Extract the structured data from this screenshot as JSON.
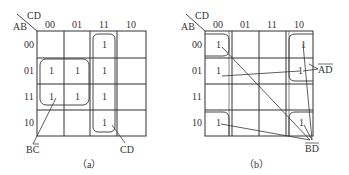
{
  "diagrams": [
    {
      "id": "a",
      "caption": "（a）",
      "row_var": "AB",
      "col_var": "CD",
      "col_labels": [
        "00",
        "01",
        "11",
        "10"
      ],
      "row_labels": [
        "00",
        "01",
        "11",
        "10"
      ],
      "cells": [
        [
          "",
          "",
          "1",
          ""
        ],
        [
          "1",
          "1",
          "1",
          ""
        ],
        [
          "1",
          "1",
          "1",
          ""
        ],
        [
          "",
          "",
          "1",
          ""
        ]
      ],
      "groups": [
        {
          "label": "BC̄",
          "label_main": "BC",
          "overbar": "C",
          "cells": [
            [
              1,
              0
            ],
            [
              1,
              1
            ],
            [
              2,
              0
            ],
            [
              2,
              1
            ]
          ]
        },
        {
          "label": "CD",
          "label_main": "CD",
          "overbar": "",
          "cells": [
            [
              0,
              2
            ],
            [
              1,
              2
            ],
            [
              2,
              2
            ],
            [
              3,
              2
            ]
          ]
        }
      ]
    },
    {
      "id": "b",
      "caption": "（b）",
      "row_var": "AB",
      "col_var": "CD",
      "col_labels": [
        "00",
        "01",
        "11",
        "10"
      ],
      "row_labels": [
        "00",
        "01",
        "11",
        "10"
      ],
      "cells": [
        [
          "1",
          "",
          "",
          "1"
        ],
        [
          "1",
          "",
          "",
          "1"
        ],
        [
          "",
          "",
          "",
          ""
        ],
        [
          "1",
          "",
          "",
          "1"
        ]
      ],
      "groups": [
        {
          "label": "ĀD̄",
          "label_main": "AD",
          "overbar": "AD",
          "cells": [
            [
              0,
              0
            ],
            [
              1,
              0
            ],
            [
              0,
              3
            ],
            [
              1,
              3
            ]
          ]
        },
        {
          "label": "B̄D̄",
          "label_main": "BD",
          "overbar": "BD",
          "cells": [
            [
              0,
              0
            ],
            [
              0,
              3
            ],
            [
              3,
              0
            ],
            [
              3,
              3
            ]
          ]
        }
      ]
    }
  ]
}
